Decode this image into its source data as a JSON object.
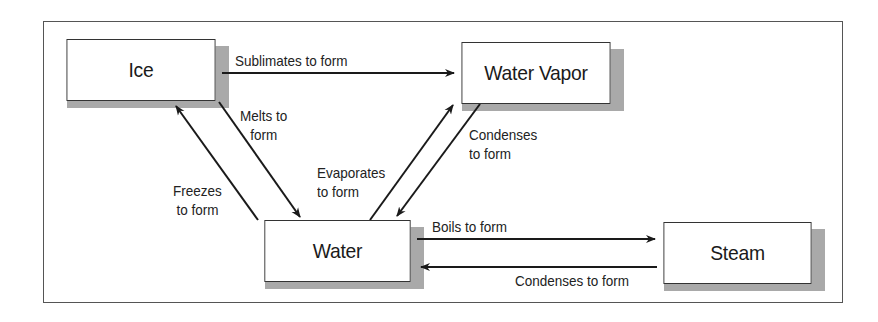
{
  "diagram": {
    "type": "state-transition",
    "nodes": [
      {
        "id": "ice",
        "label": "Ice"
      },
      {
        "id": "water_vapor",
        "label": "Water Vapor"
      },
      {
        "id": "water",
        "label": "Water"
      },
      {
        "id": "steam",
        "label": "Steam"
      }
    ],
    "edges": [
      {
        "from": "ice",
        "to": "water_vapor",
        "label": "Sublimates to form"
      },
      {
        "from": "ice",
        "to": "water",
        "label_lines": [
          "Melts to",
          "form"
        ]
      },
      {
        "from": "water",
        "to": "ice",
        "label_lines": [
          "Freezes",
          "to form"
        ]
      },
      {
        "from": "water",
        "to": "water_vapor",
        "label_lines": [
          "Evaporates",
          "to form"
        ]
      },
      {
        "from": "water_vapor",
        "to": "water",
        "label_lines": [
          "Condenses",
          "to form"
        ]
      },
      {
        "from": "water",
        "to": "steam",
        "label": "Boils to form"
      },
      {
        "from": "steam",
        "to": "water",
        "label": "Condenses to form"
      }
    ],
    "colors": {
      "line": "#1a1a1a",
      "box_border": "#333333",
      "shadow": "#a9a9a9",
      "frame": "#555555"
    }
  }
}
